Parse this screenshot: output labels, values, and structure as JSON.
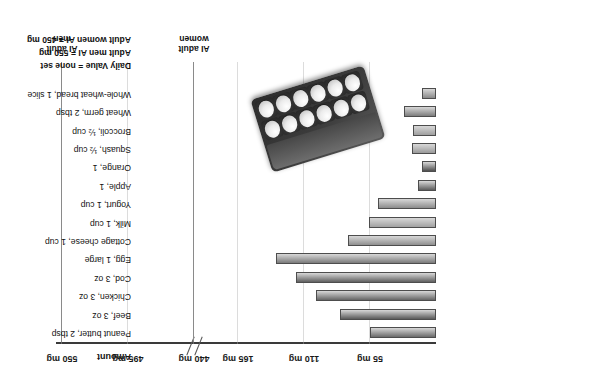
{
  "chart_data": {
    "type": "bar",
    "title": "",
    "xlabel": "",
    "ylabel": "",
    "orientation": "horizontal",
    "amount_header": "Amount",
    "axis_unit": "mg",
    "axis_has_break": true,
    "axis_break_between": [
      165,
      440
    ],
    "tick_labels": [
      "55 mg",
      "110 mg",
      "165 mg",
      "440 mg",
      "495 mg",
      "550 mg"
    ],
    "tick_values": [
      55,
      110,
      165,
      440,
      495,
      550
    ],
    "xlim": [
      0,
      550
    ],
    "grid": true,
    "legend": "none",
    "categories": [
      "Peanut butter, 2 tbsp",
      "Beef, 3 oz",
      "Chicken, 3 oz",
      "Cod, 3 oz",
      "Egg, 1 large",
      "Cottage cheese, 1 cup",
      "Milk, 1 cup",
      "Yogurt, 1 cup",
      "Apple, 1",
      "Orange, 1",
      "Squash, ½ cup",
      "Broccoli, ½ cup",
      "Wheat germ, 2 tbsp",
      "Whole-wheat bread, 1 slice"
    ],
    "values": [
      55,
      80,
      100,
      117,
      133,
      73,
      56,
      48,
      15,
      12,
      20,
      19,
      27,
      12
    ],
    "reference_lines": [
      {
        "label_line1": "AI adult",
        "label_line2": "women",
        "value": 440
      },
      {
        "label_line1": "AI adult",
        "label_line2": "men",
        "value": 550
      }
    ]
  },
  "footnotes": [
    "Daily Value = none set",
    "Adult men AI  =  550 mg",
    "Adult women AI  =  450 mg"
  ],
  "photo": {
    "alt": "egg-carton-photo"
  }
}
